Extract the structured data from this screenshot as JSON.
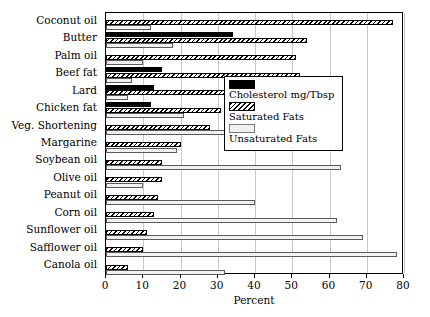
{
  "chart_data": {
    "type": "bar",
    "orientation": "horizontal",
    "title": "",
    "xlabel": "Percent",
    "ylabel": "",
    "xlim": [
      0,
      80
    ],
    "xticks": [
      0,
      10,
      20,
      30,
      40,
      50,
      60,
      70,
      80
    ],
    "grid": true,
    "legend_position": "center-right",
    "categories": [
      "Coconut oil",
      "Butter",
      "Palm oil",
      "Beef fat",
      "Lard",
      "Chicken fat",
      "Veg. Shortening",
      "Margarine",
      "Soybean oil",
      "Olive oil",
      "Peanut oil",
      "Corn oil",
      "Sunflower oil",
      "Safflower oil",
      "Canola oil"
    ],
    "series": [
      {
        "name": "Cholesterol mg/Tbsp",
        "fill": "solid-black",
        "color": "#000000",
        "values": [
          0,
          34,
          0,
          15,
          13,
          12,
          0,
          0,
          0,
          0,
          0,
          0,
          0,
          0,
          0
        ]
      },
      {
        "name": "Saturated Fats",
        "fill": "hatched",
        "color": "#000000",
        "values": [
          77,
          54,
          51,
          52,
          43,
          31,
          28,
          20,
          15,
          15,
          14,
          13,
          11,
          10,
          6
        ]
      },
      {
        "name": "Unsaturated Fats",
        "fill": "light-gray",
        "color": "#f2f2f2",
        "values": [
          12,
          18,
          10,
          7,
          6,
          21,
          32,
          19,
          63,
          10,
          40,
          62,
          69,
          78,
          32
        ]
      }
    ]
  },
  "legend": {
    "items": [
      {
        "label": "Cholesterol mg/Tbsp",
        "swatch": "solid-black"
      },
      {
        "label": "Saturated Fats",
        "swatch": "hatched"
      },
      {
        "label": "Unsaturated Fats",
        "swatch": "light-gray"
      }
    ]
  }
}
